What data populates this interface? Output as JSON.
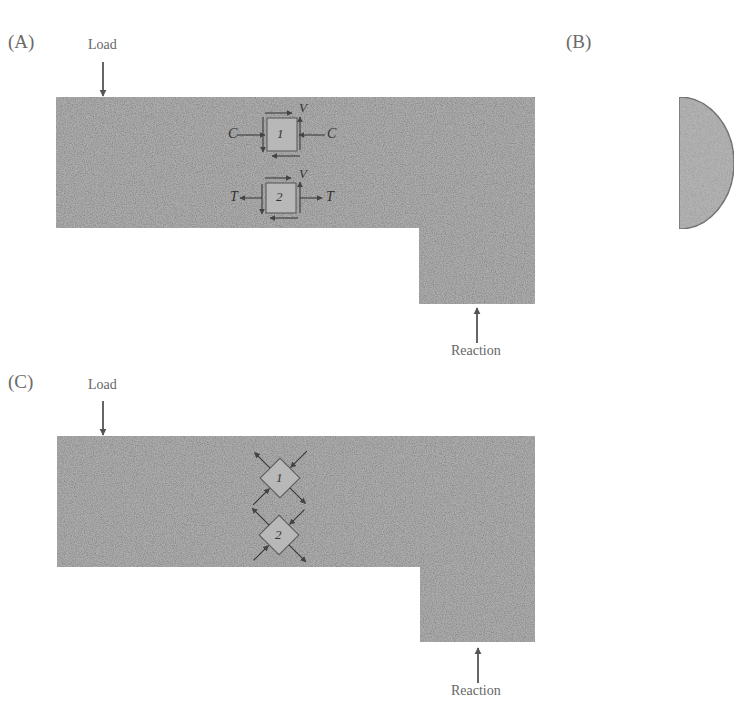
{
  "panels": {
    "a": {
      "label": "(A)",
      "load_label": "Load",
      "reaction_label": "Reaction",
      "element_1": {
        "id": "1",
        "left_force": "C",
        "right_force": "C",
        "shear": "V"
      },
      "element_2": {
        "id": "2",
        "left_force": "T",
        "right_force": "T",
        "shear": "V"
      }
    },
    "b": {
      "label": "(B)",
      "shape": "half-disc cross-section"
    },
    "c": {
      "label": "(C)",
      "load_label": "Load",
      "reaction_label": "Reaction",
      "element_1": {
        "id": "1"
      },
      "element_2": {
        "id": "2"
      }
    }
  },
  "colors": {
    "beam_fill": "#a9a9a9",
    "beam_texture_dark": "#8c8c8c",
    "beam_texture_light": "#c4c4c4",
    "arrow": "#555555",
    "element_fill": "#b8b8b8",
    "element_stroke": "#555555",
    "half_disc_fill": "#b3b3b3",
    "half_disc_stroke": "#777777"
  }
}
